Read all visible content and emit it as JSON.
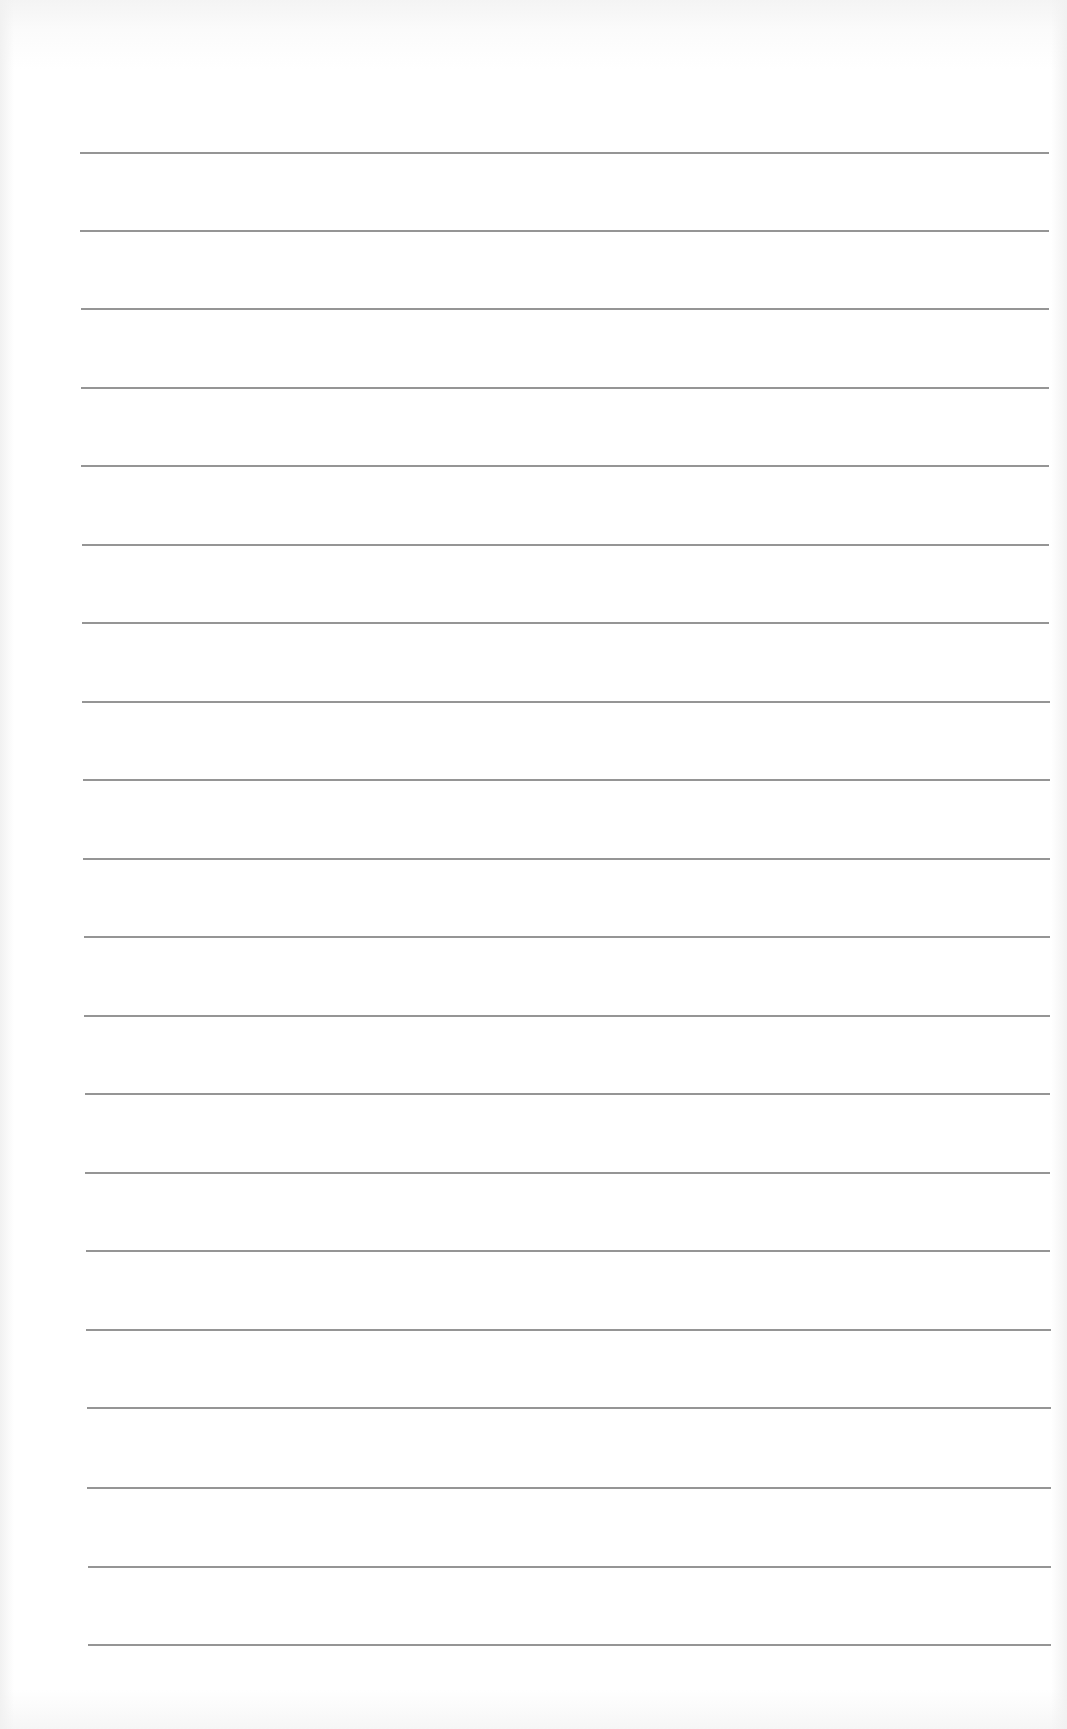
{
  "page": {
    "type": "blank-lined-paper",
    "background_color": "#ffffff",
    "rule_color": "#8a8a8a",
    "rules": [
      {
        "y": 153,
        "x1": 80,
        "x2": 1049
      },
      {
        "y": 231,
        "x1": 80,
        "x2": 1049
      },
      {
        "y": 309,
        "x1": 81,
        "x2": 1049
      },
      {
        "y": 388,
        "x1": 81,
        "x2": 1049
      },
      {
        "y": 466,
        "x1": 81,
        "x2": 1049
      },
      {
        "y": 545,
        "x1": 82,
        "x2": 1049
      },
      {
        "y": 623,
        "x1": 82,
        "x2": 1049
      },
      {
        "y": 702,
        "x1": 82,
        "x2": 1050
      },
      {
        "y": 780,
        "x1": 83,
        "x2": 1050
      },
      {
        "y": 859,
        "x1": 83,
        "x2": 1050
      },
      {
        "y": 937,
        "x1": 84,
        "x2": 1050
      },
      {
        "y": 1016,
        "x1": 84,
        "x2": 1050
      },
      {
        "y": 1094,
        "x1": 85,
        "x2": 1050
      },
      {
        "y": 1173,
        "x1": 85,
        "x2": 1050
      },
      {
        "y": 1251,
        "x1": 86,
        "x2": 1050
      },
      {
        "y": 1330,
        "x1": 86,
        "x2": 1051
      },
      {
        "y": 1408,
        "x1": 87,
        "x2": 1051
      },
      {
        "y": 1488,
        "x1": 87,
        "x2": 1051
      },
      {
        "y": 1567,
        "x1": 88,
        "x2": 1051
      },
      {
        "y": 1645,
        "x1": 88,
        "x2": 1051
      }
    ]
  }
}
